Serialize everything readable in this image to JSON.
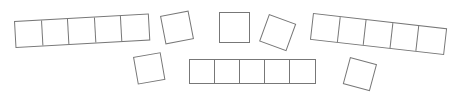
{
  "canvas": {
    "width": 459,
    "height": 95,
    "background": "#ffffff",
    "stroke_color": "#777777",
    "stroke_width": 1,
    "fill": "transparent",
    "description": "Nine outlined square tile groups arranged in a loose arc"
  },
  "shapes": [
    {
      "id": "strip-left",
      "kind": "strip",
      "cells": 5,
      "cell_size": 27,
      "x": 14,
      "y": 21,
      "rotation_deg": -3.2,
      "label": "left-strip-5-squares"
    },
    {
      "id": "square-upper-left",
      "kind": "single",
      "cells": 1,
      "cell_size": 29,
      "x": 160,
      "y": 16,
      "rotation_deg": -11,
      "label": "single-square-upper-left"
    },
    {
      "id": "square-center-top",
      "kind": "single",
      "cells": 1,
      "cell_size": 31,
      "x": 219,
      "y": 12,
      "rotation_deg": 0,
      "label": "single-square-center-top"
    },
    {
      "id": "square-upper-right",
      "kind": "single",
      "cells": 1,
      "cell_size": 29,
      "x": 269,
      "y": 14,
      "rotation_deg": 20,
      "label": "single-square-upper-right"
    },
    {
      "id": "strip-right",
      "kind": "strip",
      "cells": 5,
      "cell_size": 27,
      "x": 313,
      "y": 13,
      "rotation_deg": 6.5,
      "label": "right-strip-5-squares"
    },
    {
      "id": "square-lower-left",
      "kind": "single",
      "cells": 1,
      "cell_size": 28,
      "x": 133,
      "y": 57,
      "rotation_deg": -10,
      "label": "single-square-lower-left"
    },
    {
      "id": "strip-bottom",
      "kind": "strip",
      "cells": 5,
      "cell_size": 25.4,
      "x": 189,
      "y": 59,
      "rotation_deg": 0,
      "label": "bottom-strip-5-squares"
    },
    {
      "id": "square-lower-right",
      "kind": "single",
      "cells": 1,
      "cell_size": 28,
      "x": 350,
      "y": 57,
      "rotation_deg": 15,
      "label": "single-square-lower-right"
    }
  ],
  "totals": {
    "shape_groups": 8,
    "total_squares": 20
  }
}
